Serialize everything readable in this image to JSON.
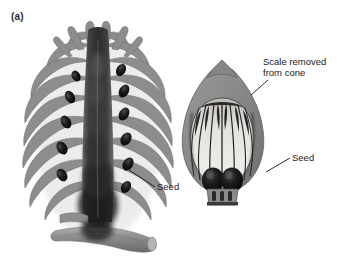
{
  "figure": {
    "panel_label": "(a)",
    "cut_off_header_text": "··   ··",
    "background_color": "#ffffff",
    "ink_color": "#1c1c1c"
  },
  "labels": {
    "seed_left": "Seed",
    "scale_removed_line1": "Scale removed",
    "scale_removed_line2": "from cone",
    "seed_right": "Seed"
  },
  "specimens": [
    {
      "id": "frond",
      "name": "pinnate-frond-with-seeds",
      "description": "Fossil seed-fern frond with paired pinnae and attached seeds on a dark central rachis",
      "pinnae_pairs": 9,
      "seed_count_visible": 11,
      "tissue_color": "#8f8f8f",
      "rachis_color": "#3a3a3a",
      "seed_color": "#151515",
      "stem_color": "#9a9a9a"
    },
    {
      "id": "cone-scale",
      "name": "cone-scale-with-seeds",
      "description": "Single cone scale removed from the cone, fan-striated inner face with two ovulate seeds at the base",
      "seed_count_visible": 2,
      "outer_color": "#8a8a8a",
      "inner_pale_color": "#e8e6e2",
      "groove_color": "#2a2a2a",
      "seed_color": "#101010"
    }
  ],
  "colors": {
    "tissue_gray": "#8f8f8f",
    "tissue_gray_dark": "#787878",
    "rachis_dark": "#3a3a3a",
    "seed_black": "#141414",
    "scale_pale": "#e8e6e2",
    "paper_white": "#ffffff",
    "leader_line": "#161616"
  }
}
